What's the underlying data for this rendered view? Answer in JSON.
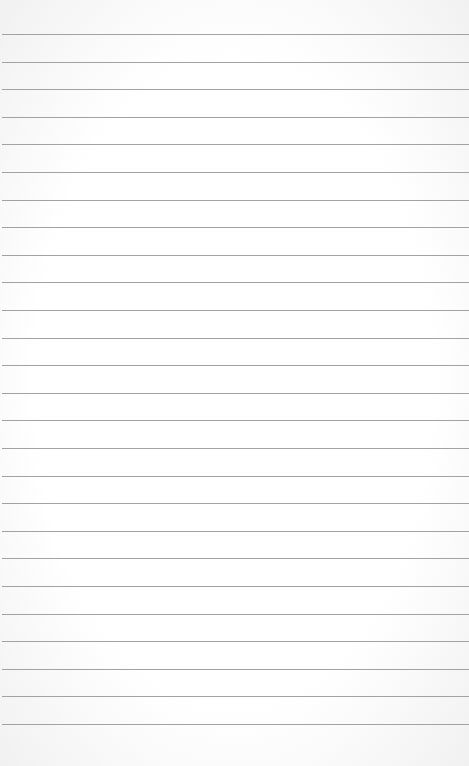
{
  "paper": {
    "type": "lined-paper",
    "line_count": 26,
    "first_line_y": 34,
    "line_spacing": 27.6,
    "line_color": "#a2a2a2",
    "background_color": "#ffffff"
  }
}
